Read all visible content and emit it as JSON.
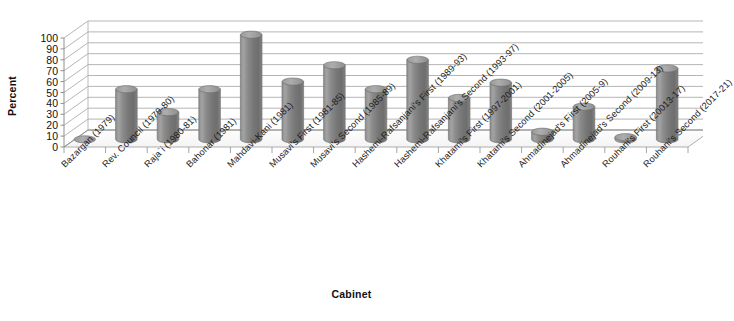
{
  "chart_data": {
    "type": "bar",
    "title": "",
    "subtitle": "",
    "xlabel": "Cabinet",
    "ylabel": "Percent",
    "ylim": [
      0,
      100
    ],
    "yticks": [
      100,
      90,
      80,
      70,
      60,
      50,
      40,
      30,
      20,
      10,
      0
    ],
    "grid": true,
    "legend": "none",
    "style": "3d-cylinder",
    "series_name": "Percent",
    "bar_color": "#808080",
    "categories": [
      "Bazargan (1979)",
      "Rev. Council (1979-80)",
      "Raja`i (1980-81)",
      "Bahonar (1981)",
      "Mahdavi-Kani (1981)",
      "Musavi's First (1981-85)",
      "Musavi's Second (1985-89)",
      "Hashemi-Rafsanjani's First (1989-93)",
      "Hashemi-Rafsanjani's Second (1993-97)",
      "Khatami's First (1997-2001)",
      "Khatami's Second (2001-2005)",
      "Ahmadinejad's First (2005-9)",
      "Ahmadinejad's Second (2009-13)",
      "Rouhani's First (20013-17)",
      "Rouhani's Second (2017-21)"
    ],
    "values": [
      0,
      46,
      25,
      46,
      96,
      53,
      68,
      46,
      73,
      38,
      52,
      7,
      30,
      2,
      65
    ]
  }
}
